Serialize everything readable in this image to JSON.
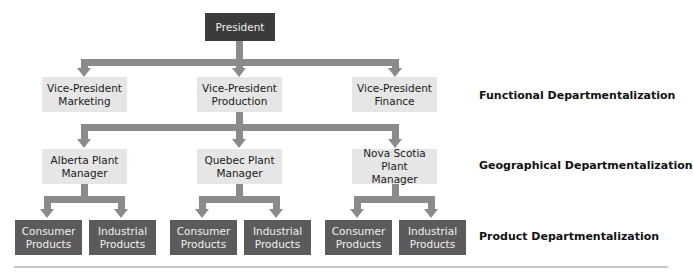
{
  "colors": {
    "connector": "#8b8b8b",
    "president_box": "#3b3b3b",
    "product_box": "#5b5b5b",
    "manager_box": "#e6e6e6"
  },
  "president": {
    "label": "President"
  },
  "vice_presidents": [
    {
      "line1": "Vice-President",
      "line2": "Marketing"
    },
    {
      "line1": "Vice-President",
      "line2": "Production"
    },
    {
      "line1": "Vice-President",
      "line2": "Finance"
    }
  ],
  "plant_managers": [
    {
      "line1": "Alberta Plant",
      "line2": "Manager"
    },
    {
      "line1": "Quebec Plant",
      "line2": "Manager"
    },
    {
      "line1": "Nova Scotia Plant",
      "line2": "Manager"
    }
  ],
  "products": [
    {
      "line1": "Consumer",
      "line2": "Products"
    },
    {
      "line1": "Industrial",
      "line2": "Products"
    },
    {
      "line1": "Consumer",
      "line2": "Products"
    },
    {
      "line1": "Industrial",
      "line2": "Products"
    },
    {
      "line1": "Consumer",
      "line2": "Products"
    },
    {
      "line1": "Industrial",
      "line2": "Products"
    }
  ],
  "level_labels": {
    "functional": "Functional Departmentalization",
    "geographical": "Geographical Departmentalization",
    "product": "Product Departmentalization"
  }
}
